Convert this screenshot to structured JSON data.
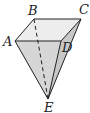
{
  "diagram": {
    "labels": {
      "A": "A",
      "B": "B",
      "C": "C",
      "D": "D",
      "E": "E"
    },
    "colors": {
      "stroke": "#222222",
      "face_light": "#e6e6e6",
      "face_mid": "#d2d2d2",
      "face_dark": "#c4c4c4"
    },
    "edges": {
      "solid": [
        "AB",
        "BC",
        "CD",
        "DA",
        "AE",
        "CE",
        "DE"
      ],
      "dashed": [
        "BE"
      ]
    }
  }
}
